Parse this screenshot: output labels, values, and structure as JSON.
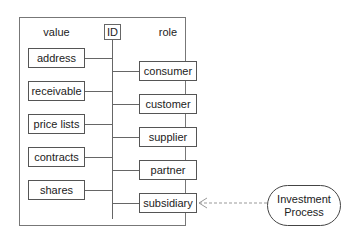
{
  "diagram": {
    "headers": {
      "value": "value",
      "id": "ID",
      "role": "role"
    },
    "value_items": [
      {
        "label": "address"
      },
      {
        "label": "receivable"
      },
      {
        "label": "price lists"
      },
      {
        "label": "contracts"
      },
      {
        "label": "shares"
      }
    ],
    "role_items": [
      {
        "label": "consumer"
      },
      {
        "label": "customer"
      },
      {
        "label": "supplier"
      },
      {
        "label": "partner"
      },
      {
        "label": "subsidiary"
      }
    ],
    "external": {
      "line1": "Investment",
      "line2": "Process"
    },
    "colors": {
      "line": "#666666",
      "dashed": "#999999",
      "border": "#555555"
    }
  }
}
